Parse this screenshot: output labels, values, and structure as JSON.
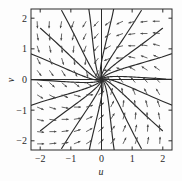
{
  "chart_data": {
    "type": "scatter",
    "title": "",
    "subtitle": "",
    "xlabel": "u",
    "ylabel": "v",
    "xlim": [
      -2.3,
      2.3
    ],
    "ylim": [
      -2.3,
      2.3
    ],
    "xticks": [
      -2,
      -1,
      0,
      1,
      2
    ],
    "yticks": [
      -2,
      -1,
      0,
      1,
      2
    ],
    "xtick_labels": [
      "−2",
      "−1",
      "0",
      "1",
      "2"
    ],
    "ytick_labels": [
      "−2",
      "−1",
      "0",
      "1",
      "2"
    ],
    "grid": false,
    "legend": "none",
    "annotations": [],
    "fixed_point": {
      "u": 0,
      "v": 0,
      "kind": "stable-node"
    },
    "field": {
      "du": "-u - v",
      "dv": "u - v",
      "arrow_rule": "arrows point inward toward the origin; rotated slightly counter-clockwise",
      "sample_spacing": 0.4,
      "sample_range": [
        -2.1,
        2.1
      ]
    },
    "trajectories": {
      "count": 18,
      "start_radius": 2.6,
      "end_radius": 0.02,
      "turn": 1.15,
      "decay": 0.62,
      "start_angles_deg": [
        0,
        20,
        40,
        60,
        80,
        100,
        120,
        140,
        160,
        180,
        200,
        220,
        240,
        260,
        280,
        300,
        320,
        340
      ]
    },
    "style": {
      "curve_color": "#2b2b2b",
      "arrow_color": "#4a4a4a",
      "axis_color": "#2a2a2a",
      "frame_color": "#2a2a2a",
      "background": "#fdfdfd"
    }
  }
}
